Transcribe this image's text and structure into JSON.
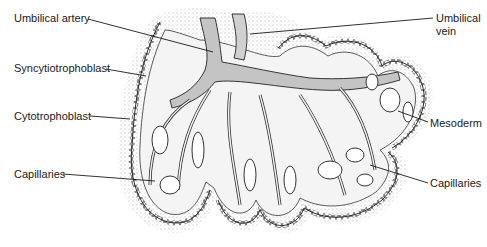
{
  "figure": {
    "colors": {
      "background": "#ffffff",
      "ink": "#1a1a1a",
      "stipple": "#9a9a9a",
      "vessel_fill": "#bdbdbd",
      "villus_core": "#f4f4f4"
    }
  },
  "labels": [
    {
      "id": "umbilical-artery",
      "text": "Umbilical artery",
      "x": 14,
      "y": 12,
      "line": [
        [
          88,
          19
        ],
        [
          213,
          52
        ]
      ]
    },
    {
      "id": "umbilical-vein-1",
      "text": "Umbilical",
      "x": 436,
      "y": 12,
      "line": [
        [
          433,
          18
        ],
        [
          250,
          34
        ]
      ]
    },
    {
      "id": "umbilical-vein-2",
      "text": "vein",
      "x": 436,
      "y": 25,
      "line": null
    },
    {
      "id": "syncytiotrophoblast",
      "text": "Syncytiotrophoblast",
      "x": 14,
      "y": 62,
      "line": [
        [
          106,
          69
        ],
        [
          146,
          76
        ]
      ]
    },
    {
      "id": "cytotrophoblast",
      "text": "Cytotrophoblast",
      "x": 14,
      "y": 110,
      "line": [
        [
          90,
          116
        ],
        [
          130,
          119
        ]
      ]
    },
    {
      "id": "mesoderm",
      "text": "Mesoderm",
      "x": 430,
      "y": 117,
      "line": [
        [
          428,
          122
        ],
        [
          398,
          111
        ]
      ]
    },
    {
      "id": "capillaries-left",
      "text": "Capillaries",
      "x": 14,
      "y": 168,
      "line": [
        [
          63,
          174
        ],
        [
          155,
          181
        ]
      ]
    },
    {
      "id": "capillaries-right",
      "text": "Capillaries",
      "x": 430,
      "y": 177,
      "line": [
        [
          428,
          183
        ],
        [
          370,
          165
        ]
      ]
    }
  ]
}
